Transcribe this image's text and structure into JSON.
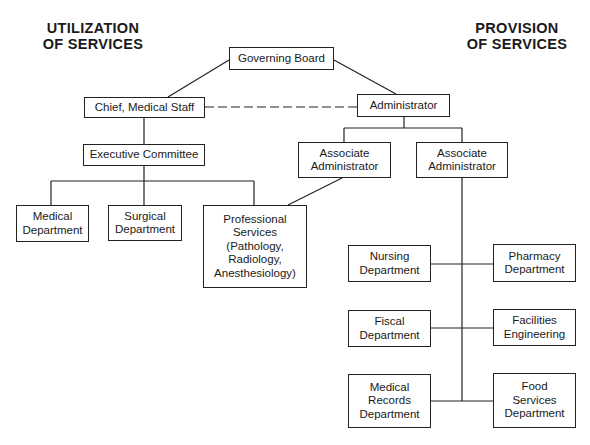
{
  "headings": {
    "left": "UTILIZATION\nOF SERVICES",
    "right": "PROVISION\nOF SERVICES"
  },
  "nodes": {
    "governing_board": "Governing Board",
    "chief_medical_staff": "Chief, Medical Staff",
    "administrator": "Administrator",
    "executive_committee": "Executive Committee",
    "associate_admin_left": "Associate\nAdministrator",
    "associate_admin_right": "Associate\nAdministrator",
    "medical_department": "Medical\nDepartment",
    "surgical_department": "Surgical\nDepartment",
    "professional_services": "Professional\nServices\n(Pathology,\nRadiology,\nAnesthesiology)",
    "nursing_department": "Nursing\nDepartment",
    "pharmacy_department": "Pharmacy\nDepartment",
    "fiscal_department": "Fiscal\nDepartment",
    "facilities_engineering": "Facilities\nEngineering",
    "medical_records_department": "Medical\nRecords\nDepartment",
    "food_services_department": "Food\nServices\nDepartment"
  },
  "edges": [
    {
      "from": "governing_board",
      "to": "chief_medical_staff",
      "style": "solid"
    },
    {
      "from": "governing_board",
      "to": "administrator",
      "style": "solid"
    },
    {
      "from": "chief_medical_staff",
      "to": "administrator",
      "style": "dashed"
    },
    {
      "from": "chief_medical_staff",
      "to": "executive_committee",
      "style": "solid"
    },
    {
      "from": "executive_committee",
      "to": "medical_department",
      "style": "solid"
    },
    {
      "from": "executive_committee",
      "to": "surgical_department",
      "style": "solid"
    },
    {
      "from": "executive_committee",
      "to": "professional_services",
      "style": "solid"
    },
    {
      "from": "administrator",
      "to": "associate_admin_left",
      "style": "solid"
    },
    {
      "from": "administrator",
      "to": "associate_admin_right",
      "style": "solid"
    },
    {
      "from": "associate_admin_left",
      "to": "professional_services",
      "style": "solid"
    },
    {
      "from": "associate_admin_right",
      "to": "nursing_department",
      "style": "solid"
    },
    {
      "from": "associate_admin_right",
      "to": "pharmacy_department",
      "style": "solid"
    },
    {
      "from": "associate_admin_right",
      "to": "fiscal_department",
      "style": "solid"
    },
    {
      "from": "associate_admin_right",
      "to": "facilities_engineering",
      "style": "solid"
    },
    {
      "from": "associate_admin_right",
      "to": "medical_records_department",
      "style": "solid"
    },
    {
      "from": "associate_admin_right",
      "to": "food_services_department",
      "style": "solid"
    }
  ]
}
